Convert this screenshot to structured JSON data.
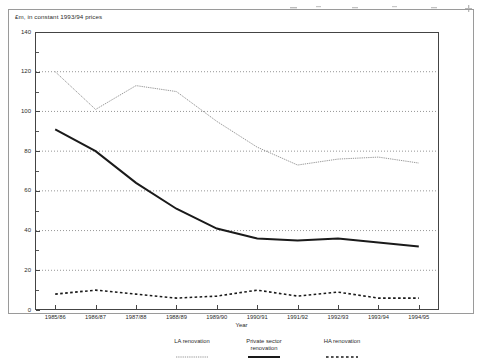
{
  "figure": {
    "unit_note": "£m, in constant 1993/94 prices"
  },
  "chart_data": {
    "type": "line",
    "title": "£m, in constant 1993/94 prices",
    "xlabel": "Year",
    "ylabel": "",
    "ylim": [
      0,
      140
    ],
    "ytick_step": 20,
    "yticks": [
      0,
      20,
      40,
      60,
      80,
      100,
      120,
      140
    ],
    "ytick_labels": [
      "0",
      "20",
      "40",
      "60",
      "80",
      "100",
      "120",
      "140"
    ],
    "minor_ytick_step": 10,
    "grid": "horizontal-dotted",
    "legend_position": "below",
    "categories": [
      "1985/86",
      "1986/87",
      "1987/88",
      "1988/89",
      "1989/90",
      "1990/91",
      "1991/92",
      "1992/93",
      "1993/94",
      "1994/95"
    ],
    "series": [
      {
        "name": "LA renovation",
        "style": "fine-dotted",
        "color": "#8d8d8d",
        "values": [
          120,
          101,
          113,
          110,
          95,
          82,
          73,
          76,
          77,
          74
        ]
      },
      {
        "name": "Private sector renovation",
        "style": "solid-thick",
        "color": "#1a1a1a",
        "values": [
          91,
          80,
          64,
          51,
          41,
          36,
          35,
          36,
          34,
          32
        ]
      },
      {
        "name": "HA renovation",
        "style": "dashed",
        "color": "#1a1a1a",
        "values": [
          8,
          10,
          8,
          6,
          7,
          10,
          7,
          9,
          6,
          6
        ]
      }
    ]
  },
  "legend": {
    "items": [
      {
        "label_line1": "LA renovation",
        "label_line2": ""
      },
      {
        "label_line1": "Private sector",
        "label_line2": "renovation"
      },
      {
        "label_line1": "HA renovation",
        "label_line2": ""
      }
    ]
  },
  "axis": {
    "x_title": "Year"
  }
}
